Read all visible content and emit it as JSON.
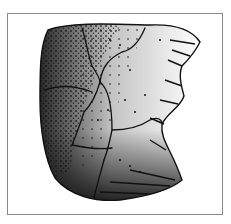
{
  "figure": {
    "frame_color": "#8a8a8a",
    "ink_color": "#111111",
    "paper_color": "#ffffff"
  }
}
